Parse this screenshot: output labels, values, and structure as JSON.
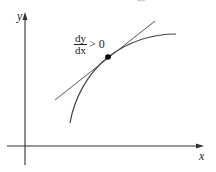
{
  "diagram": {
    "axes": {
      "x_label": "x",
      "y_label": "y"
    },
    "annotation": {
      "numerator": "dy",
      "denominator": "dx",
      "relation": "> 0"
    },
    "top_fragment": "dx",
    "elements": [
      "increasing concave-down curve",
      "tangent line",
      "point of tangency"
    ],
    "colors": {
      "lines": "#555555",
      "axes": "#333333",
      "point": "#000000"
    }
  }
}
